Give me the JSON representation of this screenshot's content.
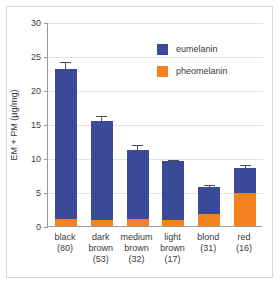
{
  "chart_data": {
    "type": "bar",
    "subtype": "stacked-bar-with-error-bars",
    "title": "",
    "xlabel": "",
    "ylabel": "EM + PM  (µg/mg)",
    "ylim": [
      0,
      30
    ],
    "yticks": [
      0,
      5,
      10,
      15,
      20,
      25,
      30
    ],
    "ytick_labels": [
      "0",
      "5",
      "10",
      "15",
      "20",
      "25",
      "30"
    ],
    "grid": "horizontal",
    "legend_position": "upper-right",
    "categories": [
      "black\n(80)",
      "dark brown\n(53)",
      "medium brown\n(32)",
      "light brown\n(17)",
      "blond\n(31)",
      "red\n(16)"
    ],
    "category_labels": [
      {
        "name": "black",
        "count": "(80)"
      },
      {
        "name": "dark",
        "name2": "brown",
        "count": "(53)"
      },
      {
        "name": "medium",
        "name2": "brown",
        "count": "(32)"
      },
      {
        "name": "light",
        "name2": "brown",
        "count": "(17)"
      },
      {
        "name": "blond",
        "count": "(31)"
      },
      {
        "name": "red",
        "count": "(16)"
      }
    ],
    "series": [
      {
        "name": "pheomelanin",
        "color": "#F58220",
        "values": [
          1.0,
          0.85,
          1.0,
          0.9,
          1.7,
          4.8
        ]
      },
      {
        "name": "eumelanin",
        "color": "#3A4A96",
        "values": [
          22.1,
          14.55,
          10.2,
          8.6,
          4.0,
          3.7
        ]
      }
    ],
    "totals": [
      23.1,
      15.4,
      11.2,
      9.5,
      5.7,
      8.5
    ],
    "errors": [
      1.1,
      0.9,
      0.9,
      0.35,
      0.5,
      0.6
    ]
  },
  "legend": {
    "items": [
      {
        "label": "eumelanin",
        "color": "#3A4A96"
      },
      {
        "label": "pheomelanin",
        "color": "#F58220"
      }
    ]
  },
  "axis": {
    "y_label": "EM + PM  (µg/mg)",
    "y_ticks": [
      "30",
      "25",
      "20",
      "15",
      "10",
      "5",
      "0"
    ]
  },
  "colors": {
    "eumelanin": "#3A4A96",
    "pheomelanin": "#F58220",
    "grid": "#e2e2e2",
    "axis": "#9a9a9a",
    "frame": "#d8d8d8",
    "text": "#3a3a3a",
    "error_bar": "#4a4a5e",
    "background": "#ffffff"
  }
}
